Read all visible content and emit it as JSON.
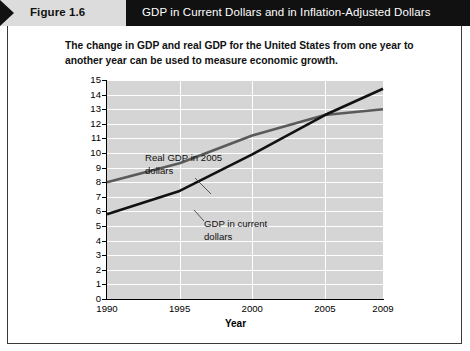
{
  "header": {
    "figure_label": "Figure 1.6",
    "title": "GDP in Current Dollars and in Inflation-Adjusted Dollars"
  },
  "subtitle": "The change in GDP and real GDP for the United States from one year to another year can be used to measure economic growth.",
  "annotations": {
    "real_gdp": "Real GDP in 2005 dollars",
    "current_gdp": "GDP in current dollars"
  },
  "colors": {
    "plot_background": "#d5d5d5",
    "gridline": "#ffffff",
    "current_gdp_line": "#111111",
    "real_gdp_line": "#5a5a5a",
    "header_bar": "#111111",
    "figure_tab": "#dcdcdc"
  },
  "chart_data": {
    "type": "line",
    "title": "GDP in Current Dollars and in Inflation-Adjusted Dollars",
    "xlabel": "Year",
    "ylabel": "Trillions of dollars",
    "xlim": [
      1990,
      2009
    ],
    "ylim": [
      0,
      15
    ],
    "xticks": [
      1990,
      1995,
      2000,
      2005,
      2009
    ],
    "xtick_labels": [
      "1990",
      "1995",
      "2000",
      "2005",
      "2009"
    ],
    "yticks": [
      0,
      1,
      2,
      3,
      4,
      5,
      6,
      7,
      8,
      9,
      10,
      11,
      12,
      13,
      14,
      15
    ],
    "ytick_labels": [
      "0",
      "1",
      "2",
      "3",
      "4",
      "5",
      "6",
      "7",
      "8",
      "9",
      "10",
      "11",
      "12",
      "13",
      "14",
      "15"
    ],
    "grid": true,
    "legend": "annotations-inline",
    "x": [
      1990,
      1995,
      2000,
      2005,
      2009
    ],
    "series": [
      {
        "name": "GDP in current dollars",
        "color": "#111111",
        "values": [
          5.8,
          7.4,
          9.9,
          12.6,
          14.4
        ]
      },
      {
        "name": "Real GDP in 2005 dollars",
        "color": "#5a5a5a",
        "values": [
          8.0,
          9.3,
          11.2,
          12.6,
          13.0
        ]
      }
    ]
  }
}
